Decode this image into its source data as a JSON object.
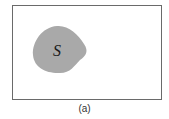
{
  "figure": {
    "caption": "(a)",
    "region_label": "S",
    "colors": {
      "frame": "#6a6a6a",
      "region_fill": "#a9a9a9",
      "label": "#1a1a1a"
    }
  }
}
